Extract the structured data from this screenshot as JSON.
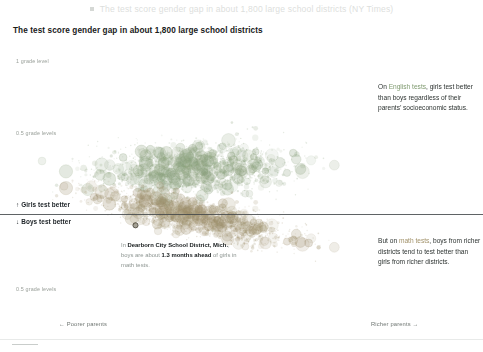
{
  "header": {
    "bullet_icon": "square-bullet-icon",
    "text": "The test score gender gap in about 1,800 large school districts (NY Times)"
  },
  "chart": {
    "title": "The test score gender gap in about 1,800 large school districts",
    "y_labels": {
      "top": "1 grade level",
      "upper_half": "0.5 grade levels",
      "lower_half": "0.5 grade levels"
    },
    "zero_labels": {
      "up": "↑ Girls test better",
      "down": "↓ Boys test better"
    },
    "x_labels": {
      "poorer": "← Poorer parents",
      "richer": "Richer parents →"
    }
  },
  "annotations": {
    "english": {
      "before": "On ",
      "highlight": "English tests",
      "after": ", girls test better than boys regardless of their parents’ socioeconomic status."
    },
    "math": {
      "before": "But on ",
      "highlight": "math tests",
      "after": ", boys from richer districts tend to test better than girls from richer districts."
    },
    "callout": {
      "lead": "In ",
      "district": "Dearborn City School District, Mich.",
      "mid": ", boys are about ",
      "value": "1.3 months ahead",
      "tail": " of girls in math tests."
    }
  },
  "colors": {
    "english_cloud": "#8aa07c",
    "math_cloud": "#9d8f6c",
    "zero_line": "#43484a",
    "title_text": "#19201a",
    "axis_text": "#9aa09a"
  },
  "chart_data": {
    "type": "scatter",
    "title": "The test score gender gap in about 1,800 large school districts",
    "xlabel": "Parents’ socioeconomic status (poorer → richer)",
    "ylabel": "Test score gender gap (grade levels)",
    "ylim": [
      -0.75,
      1.15
    ],
    "xlim": [
      0,
      1
    ],
    "grid": false,
    "legend": "none",
    "y_tick_labels": [
      "1 grade level",
      "0.5 grade levels",
      "0",
      "0.5 grade levels"
    ],
    "y_tick_values": [
      1.0,
      0.5,
      0.0,
      -0.5
    ],
    "x_tick_labels": [
      "← Poorer parents",
      "Richer parents →"
    ],
    "series": [
      {
        "name": "English tests",
        "color": "#8aa07c",
        "n_points": 1800,
        "center_x": 0.47,
        "center_y": 0.4,
        "spread_x": 0.135,
        "spread_y": 0.105,
        "slope": 0.02,
        "note": "Girls ahead at all income levels; gap roughly flat across parent income."
      },
      {
        "name": "Math tests",
        "color": "#9d8f6c",
        "n_points": 1800,
        "center_x": 0.47,
        "center_y": -0.02,
        "spread_x": 0.135,
        "spread_y": 0.075,
        "slope": -0.22,
        "note": "Gap crosses zero; boys ahead in richer districts, girls ahead in poorer districts."
      }
    ],
    "annotations": [
      {
        "label": "Dearborn City School District, Mich.",
        "value": "1.3 months ahead",
        "direction": "boys ahead",
        "x": 0.3,
        "y": -0.1
      },
      {
        "label": "On English tests, girls test better than boys regardless of their parents’ socioeconomic status.",
        "x": 0.82,
        "y": 0.62
      },
      {
        "label": "But on math tests, boys from richer districts tend to test better than girls from richer districts.",
        "x": 0.82,
        "y": -0.28
      }
    ]
  }
}
